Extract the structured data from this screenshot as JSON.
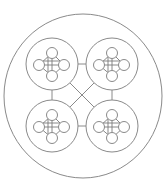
{
  "diagram": {
    "type": "nested-network",
    "colors": {
      "background": "#ffffff",
      "stroke": "#8a8a8a"
    },
    "outer": {
      "cx": 83,
      "cy": 96,
      "rx": 79,
      "ry": 82
    },
    "clusters": [
      {
        "id": "top-left",
        "cx": 52,
        "cy": 64,
        "r": 26
      },
      {
        "id": "top-right",
        "cx": 112,
        "cy": 64,
        "r": 26
      },
      {
        "id": "bottom-left",
        "cx": 52,
        "cy": 126,
        "r": 26
      },
      {
        "id": "bottom-right",
        "cx": 112,
        "cy": 126,
        "r": 26
      }
    ],
    "cluster_nodes": {
      "node_radius": 5.5,
      "offsets": [
        {
          "id": "top",
          "dx": 0,
          "dy": -11
        },
        {
          "id": "right",
          "dx": 12,
          "dy": 1
        },
        {
          "id": "bottom",
          "dx": 0,
          "dy": 12
        },
        {
          "id": "left",
          "dx": -13,
          "dy": 1
        }
      ]
    },
    "connectors": [
      {
        "id": "top-h",
        "x1": 78,
        "y1": 64,
        "x2": 86,
        "y2": 64
      },
      {
        "id": "bottom-h",
        "x1": 78,
        "y1": 126,
        "x2": 86,
        "y2": 126
      },
      {
        "id": "left-v",
        "x1": 52,
        "y1": 90,
        "x2": 52,
        "y2": 100
      },
      {
        "id": "right-v",
        "x1": 112,
        "y1": 90,
        "x2": 112,
        "y2": 100
      },
      {
        "id": "diag-1",
        "x1": 70,
        "y1": 83,
        "x2": 94,
        "y2": 107
      },
      {
        "id": "diag-2",
        "x1": 94,
        "y1": 83,
        "x2": 70,
        "y2": 107
      }
    ]
  }
}
